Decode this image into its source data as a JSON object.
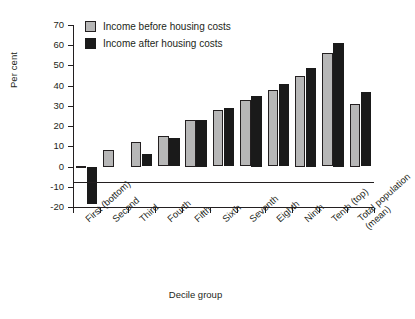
{
  "chart_data": {
    "type": "bar",
    "title": "",
    "xlabel": "Decile group",
    "ylabel": "Per cent",
    "categories": [
      "First (bottom)",
      "Second",
      "Third",
      "Fourth",
      "Fifth",
      "Sixth",
      "Seventh",
      "Eighth",
      "Ninth",
      "Tenth (top)",
      "Total population (mean)"
    ],
    "series": [
      {
        "name": "Income before housing costs",
        "color": "#b7b7b7",
        "values": [
          0.5,
          8,
          12,
          15,
          23,
          28,
          33,
          38,
          45,
          56,
          31
        ]
      },
      {
        "name": "Income after housing costs",
        "color": "#1a1a1a",
        "values": [
          -18.5,
          0,
          6,
          14,
          23,
          29,
          35,
          41,
          49,
          61,
          37
        ]
      }
    ],
    "ylim": [
      -20,
      70
    ],
    "ytick_values": [
      70,
      60,
      50,
      40,
      30,
      20,
      10,
      0,
      -10,
      -20
    ],
    "ytick_labels": [
      "70",
      "60",
      "50",
      "40",
      "30",
      "20",
      "10",
      "0",
      "-10",
      "-20"
    ],
    "grid": false,
    "legend_position": "top-left"
  },
  "legend": {
    "items": [
      {
        "label": "Income before housing costs"
      },
      {
        "label": "Income after housing costs"
      }
    ]
  }
}
